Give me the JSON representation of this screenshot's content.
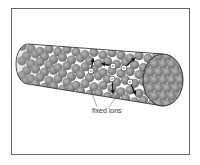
{
  "diagram": {
    "labels": {
      "fixed_ions": "fixed ions"
    },
    "colors": {
      "frame": "#666666",
      "ion_fill": "#8a8a8a",
      "ion_highlight": "#b0b0b0",
      "electron_stroke": "#333333",
      "arrow": "#111111",
      "outline": "#222222"
    },
    "electrons": [
      {
        "x": 91,
        "y": 71,
        "to": [
          93,
          60
        ]
      },
      {
        "x": 113,
        "y": 66,
        "to": [
          103,
          64
        ]
      },
      {
        "x": 124,
        "y": 68,
        "to": [
          134,
          59
        ]
      },
      {
        "x": 112,
        "y": 79,
        "to": [
          113,
          92
        ]
      },
      {
        "x": 130,
        "y": 82,
        "to": [
          135,
          93
        ]
      }
    ],
    "electron_symbol": "−"
  }
}
